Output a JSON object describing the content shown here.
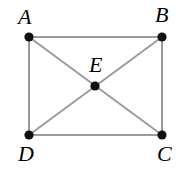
{
  "figure": {
    "type": "geometry-diagram",
    "canvas": {
      "width": 188,
      "height": 170,
      "background": "#ffffff"
    },
    "style": {
      "edge_color": "#9b9b9b",
      "edge_width": 2,
      "diagonal_color": "#9b9b9b",
      "diagonal_width": 2,
      "point_color": "#111111",
      "point_radius": 4.6,
      "label_color": "#000000"
    },
    "points": [
      {
        "id": "A",
        "label": "A",
        "x": 29,
        "y": 37,
        "label_x": 18,
        "label_y": 6,
        "role": "rectangle-corner-top-left"
      },
      {
        "id": "B",
        "label": "B",
        "x": 162,
        "y": 37,
        "label_x": 155,
        "label_y": 4,
        "role": "rectangle-corner-top-right"
      },
      {
        "id": "C",
        "label": "C",
        "x": 162,
        "y": 135,
        "label_x": 157,
        "label_y": 143,
        "role": "rectangle-corner-bottom-right"
      },
      {
        "id": "D",
        "label": "D",
        "x": 29,
        "y": 135,
        "label_x": 18,
        "label_y": 143,
        "role": "rectangle-corner-bottom-left"
      },
      {
        "id": "E",
        "label": "E",
        "x": 95,
        "y": 86,
        "label_x": 89,
        "label_y": 54,
        "role": "diagonal-intersection"
      }
    ],
    "edges": [
      {
        "id": "AB",
        "from": "A",
        "to": "B",
        "kind": "side"
      },
      {
        "id": "BC",
        "from": "B",
        "to": "C",
        "kind": "side"
      },
      {
        "id": "CD",
        "from": "C",
        "to": "D",
        "kind": "side"
      },
      {
        "id": "DA",
        "from": "D",
        "to": "A",
        "kind": "side"
      },
      {
        "id": "AC",
        "from": "A",
        "to": "C",
        "kind": "diagonal"
      },
      {
        "id": "BD",
        "from": "B",
        "to": "D",
        "kind": "diagonal"
      }
    ]
  }
}
